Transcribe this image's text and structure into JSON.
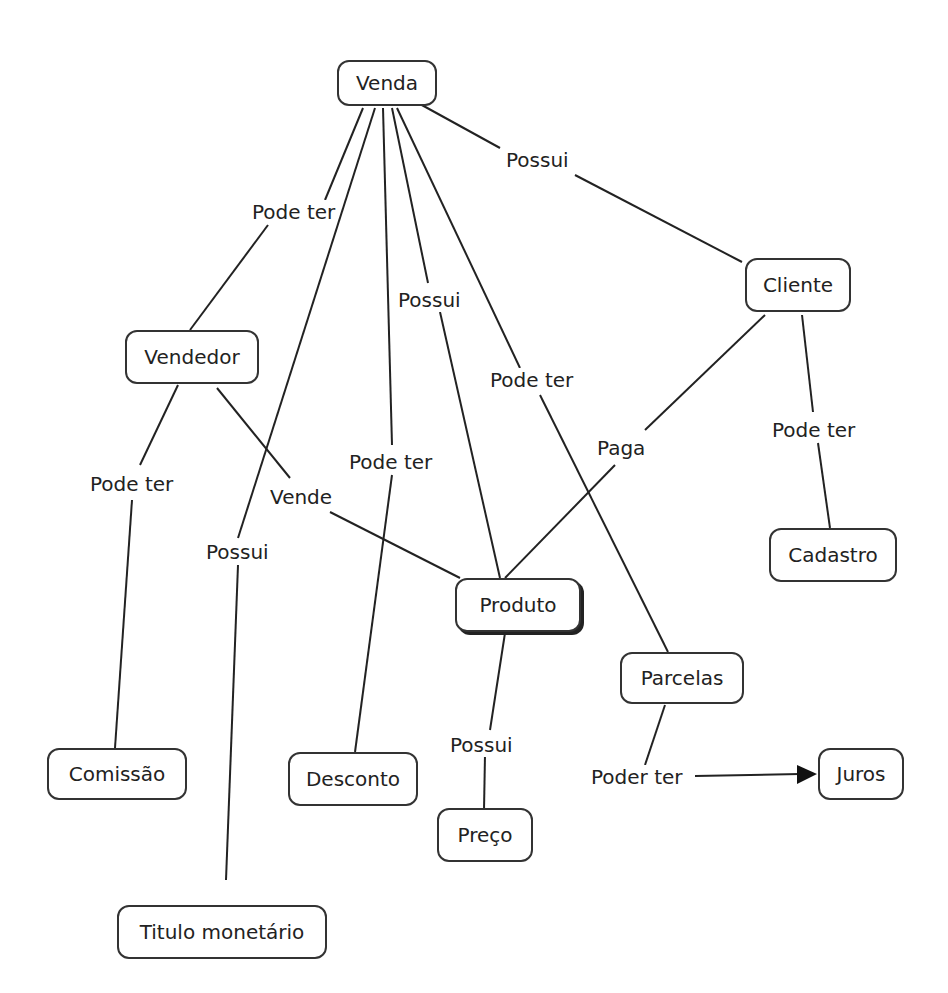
{
  "nodes": {
    "venda": {
      "label": "Venda"
    },
    "cliente": {
      "label": "Cliente"
    },
    "vendedor": {
      "label": "Vendedor"
    },
    "produto": {
      "label": "Produto"
    },
    "cadastro": {
      "label": "Cadastro"
    },
    "parcelas": {
      "label": "Parcelas"
    },
    "comissao": {
      "label": "Comissão"
    },
    "desconto": {
      "label": "Desconto"
    },
    "preco": {
      "label": "Preço"
    },
    "juros": {
      "label": "Juros"
    },
    "titulo": {
      "label": "Titulo monetário"
    }
  },
  "links": {
    "venda_cliente": "Possui",
    "venda_vendedor": "Pode ter",
    "venda_produto": "Possui",
    "venda_parcelas": "Pode ter",
    "venda_desconto": "Pode ter",
    "venda_titulo": "Possui",
    "vendedor_comissao": "Pode ter",
    "vendedor_produto": "Vende",
    "cliente_produto": "Paga",
    "cliente_cadastro": "Pode ter",
    "produto_preco": "Possui",
    "parcelas_juros": "Poder ter"
  }
}
